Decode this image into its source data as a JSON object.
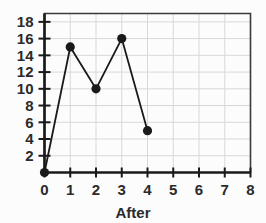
{
  "chart_data": {
    "type": "line",
    "title": "",
    "subtitle": "",
    "xlabel": "After",
    "ylabel": "",
    "x": [
      0,
      1,
      2,
      3,
      4
    ],
    "values": [
      0,
      15,
      10,
      16,
      5
    ],
    "points": [
      {
        "x": 0,
        "y": 0
      },
      {
        "x": 1,
        "y": 15
      },
      {
        "x": 2,
        "y": 10
      },
      {
        "x": 3,
        "y": 16
      },
      {
        "x": 4,
        "y": 5
      }
    ],
    "series": [
      {
        "name": "After",
        "values": [
          0,
          15,
          10,
          16,
          5
        ]
      }
    ],
    "xlim": [
      0,
      8
    ],
    "ylim": [
      0,
      19
    ],
    "xticks": [
      0,
      1,
      2,
      3,
      4,
      5,
      6,
      7,
      8
    ],
    "xtick_labels": [
      "0",
      "1",
      "2",
      "3",
      "4",
      "5",
      "6",
      "7",
      "8"
    ],
    "yticks": [
      2,
      4,
      6,
      8,
      10,
      12,
      14,
      16,
      18
    ],
    "ytick_labels": [
      "2",
      "4",
      "6",
      "8",
      "10",
      "12",
      "14",
      "16",
      "18"
    ],
    "grid": true,
    "legend": false,
    "legend_position": "none",
    "marker": "filled-circle",
    "line_color": "#1a1a1a",
    "marker_color": "#1a1a1a",
    "grid_color": "#d8d8d8",
    "frame_color": "#3a3a3a",
    "background_color": "#fcfcfc",
    "text_color": "#2b2b2b"
  },
  "axes": {
    "x_axis_name": "x-axis",
    "y_axis_name": "y-axis"
  }
}
